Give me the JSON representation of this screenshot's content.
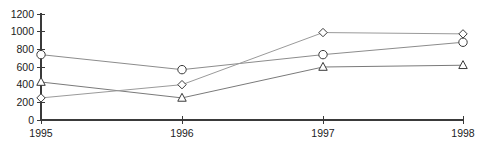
{
  "chart_data": {
    "type": "line",
    "title": "",
    "subtitle": "",
    "xlabel": "",
    "ylabel": "",
    "categories": [
      "1995",
      "1996",
      "1997",
      "1998"
    ],
    "x_tick_labels": [
      "1995",
      "1996",
      "1997",
      "1998"
    ],
    "y_tick_labels": [
      "0",
      "200",
      "400",
      "600",
      "800",
      "1000",
      "1200"
    ],
    "y_ticks": [
      0,
      200,
      400,
      600,
      800,
      1000,
      1200
    ],
    "ylim": [
      0,
      1200
    ],
    "grid": false,
    "legend": "none",
    "legend_entries": [],
    "annotations": [],
    "series": [
      {
        "name": "circle-series",
        "marker": "circle",
        "color": "#8c8c8c",
        "marker_edge_color": "#3a3a3a",
        "values": [
          740,
          570,
          740,
          880
        ]
      },
      {
        "name": "triangle-series",
        "marker": "triangle",
        "color": "#7a7a7a",
        "marker_edge_color": "#3a3a3a",
        "values": [
          430,
          250,
          600,
          620
        ]
      },
      {
        "name": "diamond-series",
        "marker": "diamond",
        "color": "#9a9a9a",
        "marker_edge_color": "#3a3a3a",
        "values": [
          250,
          400,
          990,
          975
        ]
      }
    ]
  },
  "axes": {
    "x_tick_positions_px": [
      41,
      182,
      323,
      463
    ],
    "y_zero_px": 120,
    "y_top_px": 14,
    "axis_color": "#3a3a3a"
  }
}
